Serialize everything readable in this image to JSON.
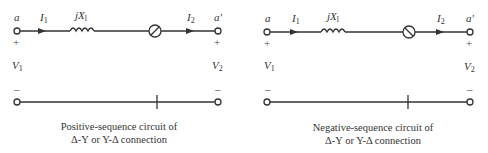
{
  "diagram": {
    "type": "sequence-circuit-comparison",
    "circuits": [
      {
        "id": "positive-sequence",
        "terminals": {
          "left": "a",
          "right": "a'"
        },
        "currents": {
          "input": "I",
          "input_sub": "1",
          "output": "I",
          "output_sub": "2"
        },
        "voltages": {
          "left": "V",
          "left_sub": "1",
          "right": "V",
          "right_sub": "2"
        },
        "polarity": {
          "top": "+",
          "bottom": "–"
        },
        "reactance": {
          "prefix": "jX",
          "sub": "l"
        },
        "phase_shifter_slash": "forward",
        "caption_line1": "Positive-sequence circuit of",
        "caption_line2": "Δ-Y or Y-Δ connection"
      },
      {
        "id": "negative-sequence",
        "terminals": {
          "left": "a",
          "right": "a'"
        },
        "currents": {
          "input": "I",
          "input_sub": "1",
          "output": "I",
          "output_sub": "2"
        },
        "voltages": {
          "left": "V",
          "left_sub": "1",
          "right": "V",
          "right_sub": "2"
        },
        "polarity": {
          "top": "+",
          "bottom": "–"
        },
        "reactance": {
          "prefix": "jX",
          "sub": "l"
        },
        "phase_shifter_slash": "backward",
        "caption_line1": "Negative-sequence circuit of",
        "caption_line2": "Δ-Y or Y-Δ connection"
      }
    ]
  },
  "colors": {
    "line": "#333333",
    "background": "#ffffff"
  }
}
